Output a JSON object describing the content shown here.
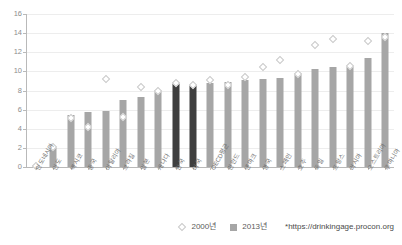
{
  "chart_data": {
    "type": "bar",
    "title": "",
    "xlabel": "",
    "ylabel": "",
    "ylim": [
      0,
      16
    ],
    "ytick_step": 2,
    "yticks": [
      0,
      2,
      4,
      6,
      8,
      10,
      12,
      14,
      16
    ],
    "grid": true,
    "legend_position": "bottom-right",
    "categories": [
      "인도네시아",
      "인도",
      "멕시코",
      "중국",
      "이탈리아",
      "브라질",
      "일본",
      "캐나다",
      "한국",
      "미국",
      "OECD평균",
      "핀란드",
      "덴마크",
      "영국",
      "스페인",
      "호주",
      "독일",
      "프랑스",
      "러시아",
      "오스트리아",
      "루마니아"
    ],
    "series": [
      {
        "name": "2000년",
        "marker": "diamond",
        "color": "#ffffff",
        "values": [
          0.1,
          2.1,
          5.1,
          4.2,
          9.2,
          5.2,
          8.4,
          7.9,
          8.8,
          8.6,
          9.1,
          8.6,
          9.4,
          10.5,
          11.2,
          9.7,
          12.8,
          13.4,
          10.6,
          13.2,
          13.6
        ]
      },
      {
        "name": "2013년",
        "marker": "bar",
        "color": "#a6a6a6",
        "highlight_color": "#3f3f3f",
        "highlight_categories": [
          "한국",
          "미국"
        ],
        "values": [
          0.1,
          2.0,
          5.4,
          5.8,
          5.9,
          7.0,
          7.3,
          8.1,
          8.7,
          8.6,
          8.8,
          8.9,
          9.1,
          9.2,
          9.3,
          9.8,
          10.2,
          10.5,
          10.5,
          11.4,
          14.0
        ]
      }
    ],
    "source_note": "*https://drinkingage.procon.org"
  }
}
